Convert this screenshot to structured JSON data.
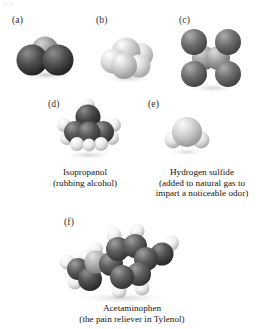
{
  "figure": {
    "kind": "space-filling molecular models plate",
    "background_color": "#ffffff",
    "text_color": "#141414",
    "scan_artifact_top": "y x"
  },
  "panels": [
    {
      "id": "a",
      "label": "(a)",
      "molecule_name": "carbon dioxide model",
      "caption_lines": [],
      "atoms": [
        {
          "element": "O",
          "color": "#4c4c4c",
          "highlight": "#8e8e8e",
          "cx": 18,
          "cy": 30,
          "r": 15.5
        },
        {
          "element": "C",
          "color": "#9a9a9a",
          "highlight": "#d4d4d4",
          "cx": 31,
          "cy": 20,
          "r": 13.5
        },
        {
          "element": "O",
          "color": "#4c4c4c",
          "highlight": "#8e8e8e",
          "cx": 44,
          "cy": 30,
          "r": 15.5
        }
      ]
    },
    {
      "id": "b",
      "label": "(b)",
      "molecule_name": "light atom cluster model",
      "caption_lines": [],
      "atoms": [
        {
          "element": "H",
          "color": "#d8d8d8",
          "highlight": "#fdfdfd",
          "cx": 17,
          "cy": 31,
          "r": 12.5
        },
        {
          "element": "C",
          "color": "#cfcfcf",
          "highlight": "#fafafa",
          "cx": 30,
          "cy": 22,
          "r": 14.5
        },
        {
          "element": "H",
          "color": "#dcdcdc",
          "highlight": "#ffffff",
          "cx": 45,
          "cy": 25,
          "r": 12.0
        },
        {
          "element": "H",
          "color": "#d2d2d2",
          "highlight": "#fbfbfb",
          "cx": 28,
          "cy": 36,
          "r": 13.0
        },
        {
          "element": "H",
          "color": "#d6d6d6",
          "highlight": "#fdfdfd",
          "cx": 43,
          "cy": 36,
          "r": 11.5
        }
      ]
    },
    {
      "id": "c",
      "label": "(c)",
      "molecule_name": "tetrachloroethylene model",
      "caption_lines": [],
      "atoms": [
        {
          "element": "Cl",
          "color": "#6e6e6e",
          "highlight": "#a8a8a8",
          "cx": 14,
          "cy": 14,
          "r": 13.0
        },
        {
          "element": "Cl",
          "color": "#6e6e6e",
          "highlight": "#a8a8a8",
          "cx": 48,
          "cy": 14,
          "r": 13.0
        },
        {
          "element": "C",
          "color": "#a6a6a6",
          "highlight": "#d8d8d8",
          "cx": 24,
          "cy": 30,
          "r": 12.0
        },
        {
          "element": "C",
          "color": "#a6a6a6",
          "highlight": "#d8d8d8",
          "cx": 38,
          "cy": 30,
          "r": 12.0
        },
        {
          "element": "Cl",
          "color": "#6e6e6e",
          "highlight": "#a8a8a8",
          "cx": 14,
          "cy": 46,
          "r": 13.0
        },
        {
          "element": "Cl",
          "color": "#6e6e6e",
          "highlight": "#a8a8a8",
          "cx": 48,
          "cy": 46,
          "r": 13.0
        }
      ]
    },
    {
      "id": "d",
      "label": "(d)",
      "molecule_name": "Isopropanol",
      "caption_lines": [
        "Isopropanol",
        "(rubbing alcohol)"
      ],
      "atoms": [
        {
          "element": "H",
          "color": "#e8e8e8",
          "highlight": "#ffffff",
          "cx": 9,
          "cy": 22,
          "r": 7.0
        },
        {
          "element": "H",
          "color": "#e8e8e8",
          "highlight": "#ffffff",
          "cx": 12,
          "cy": 35,
          "r": 7.0
        },
        {
          "element": "C",
          "color": "#5a5a5a",
          "highlight": "#9a9a9a",
          "cx": 20,
          "cy": 29,
          "r": 11.0
        },
        {
          "element": "H",
          "color": "#ececec",
          "highlight": "#ffffff",
          "cx": 22,
          "cy": 41,
          "r": 7.0
        },
        {
          "element": "O",
          "color": "#4a4a4a",
          "highlight": "#8b8b8b",
          "cx": 33,
          "cy": 14,
          "r": 12.5
        },
        {
          "element": "H",
          "color": "#ececec",
          "highlight": "#ffffff",
          "cx": 33,
          "cy": 2,
          "r": 6.5
        },
        {
          "element": "C",
          "color": "#5a5a5a",
          "highlight": "#9a9a9a",
          "cx": 34,
          "cy": 30,
          "r": 11.5
        },
        {
          "element": "C",
          "color": "#5a5a5a",
          "highlight": "#9a9a9a",
          "cx": 48,
          "cy": 29,
          "r": 11.0
        },
        {
          "element": "H",
          "color": "#e8e8e8",
          "highlight": "#ffffff",
          "cx": 59,
          "cy": 22,
          "r": 7.0
        },
        {
          "element": "H",
          "color": "#e8e8e8",
          "highlight": "#ffffff",
          "cx": 57,
          "cy": 35,
          "r": 7.0
        },
        {
          "element": "H",
          "color": "#ececec",
          "highlight": "#ffffff",
          "cx": 46,
          "cy": 41,
          "r": 7.0
        },
        {
          "element": "H",
          "color": "#ececec",
          "highlight": "#ffffff",
          "cx": 34,
          "cy": 42,
          "r": 6.5
        }
      ]
    },
    {
      "id": "e",
      "label": "(e)",
      "molecule_name": "Hydrogen sulfide",
      "caption_lines": [
        "Hydrogen sulfide",
        "(added to natural gas to",
        "impart a noticeable odor)"
      ],
      "atoms": [
        {
          "element": "H",
          "color": "#dcdcdc",
          "highlight": "#ffffff",
          "cx": 8,
          "cy": 28,
          "r": 8.5
        },
        {
          "element": "S",
          "color": "#d0d0d0",
          "highlight": "#fbfbfb",
          "cx": 22,
          "cy": 20,
          "r": 15.0
        },
        {
          "element": "H",
          "color": "#dcdcdc",
          "highlight": "#ffffff",
          "cx": 36,
          "cy": 28,
          "r": 8.5
        }
      ]
    },
    {
      "id": "f",
      "label": "(f)",
      "molecule_name": "Acetaminophen",
      "caption_lines": [
        "Acetaminophen",
        "(the pain reliever in Tylenol)"
      ],
      "atoms": [
        {
          "element": "H",
          "color": "#efefef",
          "highlight": "#ffffff",
          "cx": 6,
          "cy": 40,
          "r": 7.5
        },
        {
          "element": "C",
          "color": "#5e5e5e",
          "highlight": "#9e9e9e",
          "cx": 17,
          "cy": 47,
          "r": 11.0
        },
        {
          "element": "H",
          "color": "#efefef",
          "highlight": "#ffffff",
          "cx": 14,
          "cy": 60,
          "r": 7.5
        },
        {
          "element": "H",
          "color": "#efefef",
          "highlight": "#ffffff",
          "cx": 25,
          "cy": 35,
          "r": 7.5
        },
        {
          "element": "O",
          "color": "#515151",
          "highlight": "#8f8f8f",
          "cx": 29,
          "cy": 57,
          "r": 12.0
        },
        {
          "element": "N",
          "color": "#b3b3b3",
          "highlight": "#e4e4e4",
          "cx": 35,
          "cy": 40,
          "r": 11.5
        },
        {
          "element": "H",
          "color": "#efefef",
          "highlight": "#ffffff",
          "cx": 35,
          "cy": 27,
          "r": 7.0
        },
        {
          "element": "C",
          "color": "#5e5e5e",
          "highlight": "#9e9e9e",
          "cx": 50,
          "cy": 42,
          "r": 12.0
        },
        {
          "element": "C",
          "color": "#5e5e5e",
          "highlight": "#9e9e9e",
          "cx": 57,
          "cy": 27,
          "r": 12.0
        },
        {
          "element": "H",
          "color": "#efefef",
          "highlight": "#ffffff",
          "cx": 53,
          "cy": 13,
          "r": 7.5
        },
        {
          "element": "C",
          "color": "#5e5e5e",
          "highlight": "#9e9e9e",
          "cx": 74,
          "cy": 24,
          "r": 12.0
        },
        {
          "element": "H",
          "color": "#efefef",
          "highlight": "#ffffff",
          "cx": 76,
          "cy": 9,
          "r": 7.5
        },
        {
          "element": "C",
          "color": "#5e5e5e",
          "highlight": "#9e9e9e",
          "cx": 85,
          "cy": 37,
          "r": 12.0
        },
        {
          "element": "C",
          "color": "#5e5e5e",
          "highlight": "#9e9e9e",
          "cx": 78,
          "cy": 52,
          "r": 12.0
        },
        {
          "element": "H",
          "color": "#efefef",
          "highlight": "#ffffff",
          "cx": 81,
          "cy": 66,
          "r": 7.5
        },
        {
          "element": "C",
          "color": "#5e5e5e",
          "highlight": "#9e9e9e",
          "cx": 61,
          "cy": 55,
          "r": 12.0
        },
        {
          "element": "H",
          "color": "#efefef",
          "highlight": "#ffffff",
          "cx": 58,
          "cy": 69,
          "r": 7.5
        },
        {
          "element": "O",
          "color": "#5e5e5e",
          "highlight": "#9e9e9e",
          "cx": 101,
          "cy": 32,
          "r": 11.5
        },
        {
          "element": "H",
          "color": "#efefef",
          "highlight": "#ffffff",
          "cx": 110,
          "cy": 21,
          "r": 8.0
        }
      ]
    }
  ]
}
